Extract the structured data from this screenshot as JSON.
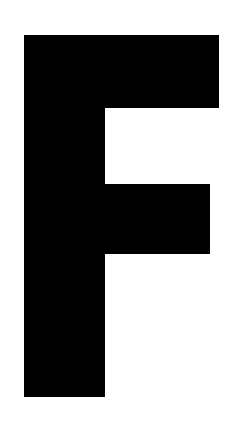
{
  "glyph": {
    "character": "F",
    "color": "#000000",
    "background": "#ffffff"
  }
}
